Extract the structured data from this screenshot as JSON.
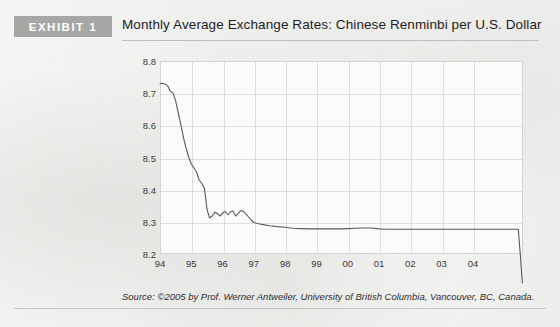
{
  "header": {
    "exhibit_label": "EXHIBIT 1",
    "title": "Monthly Average Exchange Rates: Chinese Renminbi per U.S. Dollar",
    "badge_color": "#a6a6a4"
  },
  "footer": {
    "source": "Source: ©2005 by Prof. Werner Antweiler, University of British Columbia, Vancouver, BC, Canada."
  },
  "chart_data": {
    "type": "line",
    "title": "Monthly Average Exchange Rates: Chinese Renminbi per U.S. Dollar",
    "xlabel": "",
    "ylabel": "",
    "grid": true,
    "legend": null,
    "line_color": "#5a5a5a",
    "xlim": [
      1994.0,
      2005.6
    ],
    "ylim": [
      8.2,
      8.8
    ],
    "yticks": [
      8.2,
      8.3,
      8.4,
      8.5,
      8.6,
      8.7,
      8.8
    ],
    "ytick_labels": [
      "8.2",
      "8.3",
      "8.4",
      "8.5",
      "8.6",
      "8.7",
      "8.8"
    ],
    "xticks": [
      1994,
      1995,
      1996,
      1997,
      1998,
      1999,
      2000,
      2001,
      2002,
      2003,
      2004
    ],
    "xtick_labels": [
      "94",
      "95",
      "96",
      "97",
      "98",
      "99",
      "00",
      "01",
      "02",
      "03",
      "04"
    ],
    "series": [
      {
        "name": "CNY per USD",
        "x": [
          1994.0,
          1994.08,
          1994.17,
          1994.25,
          1994.33,
          1994.42,
          1994.5,
          1994.58,
          1994.67,
          1994.75,
          1994.83,
          1994.92,
          1995.0,
          1995.08,
          1995.17,
          1995.25,
          1995.33,
          1995.42,
          1995.5,
          1995.58,
          1995.67,
          1995.75,
          1995.83,
          1995.92,
          1996.0,
          1996.08,
          1996.17,
          1996.25,
          1996.33,
          1996.42,
          1996.5,
          1996.58,
          1996.67,
          1996.75,
          1996.83,
          1996.92,
          1997.0,
          1997.25,
          1997.5,
          1997.75,
          1998.0,
          1998.25,
          1998.5,
          1998.75,
          1999.0,
          1999.25,
          1999.5,
          1999.75,
          2000.0,
          2000.25,
          2000.5,
          2000.75,
          2001.0,
          2001.25,
          2001.5,
          2001.75,
          2002.0,
          2002.25,
          2002.5,
          2002.75,
          2003.0,
          2003.25,
          2003.5,
          2003.75,
          2004.0,
          2004.25,
          2004.5,
          2004.75,
          2005.0,
          2005.25,
          2005.45,
          2005.52,
          2005.58
        ],
        "y": [
          8.73,
          8.731,
          8.728,
          8.722,
          8.706,
          8.7,
          8.676,
          8.64,
          8.6,
          8.562,
          8.53,
          8.5,
          8.48,
          8.468,
          8.455,
          8.43,
          8.42,
          8.405,
          8.34,
          8.312,
          8.318,
          8.33,
          8.326,
          8.318,
          8.328,
          8.332,
          8.322,
          8.331,
          8.334,
          8.318,
          8.326,
          8.335,
          8.332,
          8.324,
          8.315,
          8.305,
          8.298,
          8.292,
          8.288,
          8.285,
          8.283,
          8.28,
          8.279,
          8.278,
          8.278,
          8.278,
          8.278,
          8.278,
          8.279,
          8.28,
          8.281,
          8.281,
          8.278,
          8.277,
          8.277,
          8.277,
          8.277,
          8.277,
          8.277,
          8.277,
          8.277,
          8.277,
          8.277,
          8.277,
          8.277,
          8.277,
          8.277,
          8.277,
          8.277,
          8.277,
          8.277,
          8.19,
          8.11
        ]
      }
    ],
    "annotations": []
  }
}
